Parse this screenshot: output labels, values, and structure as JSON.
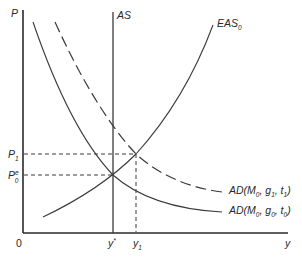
{
  "diagram": {
    "type": "AS-AD macroeconomic diagram",
    "axes": {
      "y_label": "P",
      "x_label": "y",
      "origin_label": "0"
    },
    "curves": {
      "as": {
        "label": "AS",
        "style": "solid vertical"
      },
      "eas": {
        "label_main": "EAS",
        "label_sub": "0",
        "style": "solid upward-sloping"
      },
      "ad0": {
        "label_prefix": "AD(M",
        "sub1": "0",
        "mid1": ", g",
        "sub2": "0",
        "mid2": ", t",
        "sub3": "0",
        "suffix": ")",
        "style": "solid downward-sloping"
      },
      "ad1": {
        "label_prefix": "AD(M",
        "sub1": "0",
        "mid1": ", g",
        "sub2": "1",
        "mid2": ", t",
        "sub3": "1",
        "suffix": ")",
        "style": "dashed downward-sloping"
      }
    },
    "price_levels": {
      "p1": {
        "main": "P",
        "sub": "1"
      },
      "p0": {
        "main": "P",
        "sub": "0",
        "sup": "e"
      }
    },
    "output_levels": {
      "ystar": {
        "main": "y",
        "sup": "*"
      },
      "y1": {
        "main": "y",
        "sub": "1"
      }
    },
    "colors": {
      "line": "#3a3a3a",
      "axis": "#2a2a2a",
      "background": "#ffffff"
    }
  }
}
